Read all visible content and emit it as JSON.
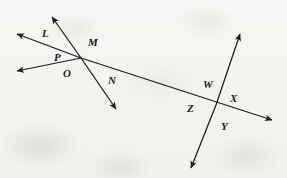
{
  "figure": {
    "name": "intersecting-lines-and-rays-diagram",
    "width": 287,
    "height": 178,
    "background_color": "#f6f5f3",
    "ink_color": "#1b1b1b"
  },
  "labels": [
    {
      "id": "L",
      "text": "L",
      "x": 42,
      "y": 28
    },
    {
      "id": "M",
      "text": "M",
      "x": 88,
      "y": 37
    },
    {
      "id": "P",
      "text": "P",
      "x": 54,
      "y": 52
    },
    {
      "id": "O",
      "text": "O",
      "x": 63,
      "y": 68
    },
    {
      "id": "N",
      "text": "N",
      "x": 108,
      "y": 75
    },
    {
      "id": "W",
      "text": "W",
      "x": 203,
      "y": 79
    },
    {
      "id": "X",
      "text": "X",
      "x": 230,
      "y": 93
    },
    {
      "id": "Z",
      "text": "Z",
      "x": 187,
      "y": 103
    },
    {
      "id": "Y",
      "text": "Y",
      "x": 221,
      "y": 121
    }
  ],
  "points": {
    "vertex_left": {
      "x": 81,
      "y": 58
    },
    "vertex_right": {
      "x": 216,
      "y": 105
    }
  },
  "segments": [
    {
      "id": "ray-LM-upper",
      "name": "ray-through-M-upper-left",
      "x1": 81,
      "y1": 58,
      "x2": 51,
      "y2": 15,
      "arrow_end": true
    },
    {
      "id": "ray-MN-lower",
      "name": "ray-N-lower-right",
      "x1": 81,
      "y1": 58,
      "x2": 118,
      "y2": 112,
      "arrow_end": true
    },
    {
      "id": "ray-L-left",
      "name": "ray-L-upper-left",
      "x1": 81,
      "y1": 58,
      "x2": 14,
      "y2": 33,
      "arrow_end": true
    },
    {
      "id": "ray-O-left",
      "name": "ray-O-lower-left",
      "x1": 81,
      "y1": 58,
      "x2": 14,
      "y2": 72,
      "arrow_end": true
    },
    {
      "id": "line-main",
      "name": "long-transversal-line",
      "x1": 81,
      "y1": 58,
      "x2": 275,
      "y2": 121,
      "arrow_end": true
    },
    {
      "id": "line-WY-up",
      "name": "ray-W-upper-right",
      "x1": 216,
      "y1": 105,
      "x2": 241,
      "y2": 31,
      "arrow_end": true
    },
    {
      "id": "line-ZY-down",
      "name": "ray-Z-lower-left",
      "x1": 216,
      "y1": 105,
      "x2": 190,
      "y2": 171,
      "arrow_end": true
    }
  ]
}
